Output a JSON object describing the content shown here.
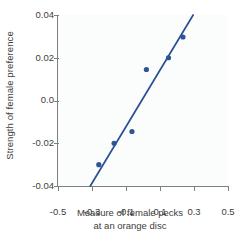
{
  "chart_data": {
    "type": "scatter",
    "title": "",
    "xlabel": "Measure of female pecks at an orange disc",
    "xlabel_line1": "Measure of female pecks",
    "xlabel_line2": "at an orange disc",
    "ylabel": "Strength of female preference",
    "xlim": [
      -0.5,
      0.5
    ],
    "ylim": [
      -0.04,
      0.04
    ],
    "xticks": [
      "-0.5",
      "-0.3",
      "-0.1",
      "0.1",
      "0.3",
      "0.5"
    ],
    "xtick_values": [
      -0.5,
      -0.3,
      -0.1,
      0.1,
      0.3,
      0.5
    ],
    "yticks": [
      "0.04",
      "0.02",
      "0.0",
      "-0.02",
      "-0.04"
    ],
    "ytick_values": [
      0.04,
      0.02,
      0.0,
      -0.02,
      -0.04
    ],
    "grid": false,
    "legend": "none",
    "point_color": "#2e5496",
    "line_color": "#2b4f94",
    "plot_background": "#fbfcfc",
    "axis_color": "#7e7e7e",
    "points": [
      {
        "x": -0.26,
        "y": -0.03
      },
      {
        "x": -0.17,
        "y": -0.02
      },
      {
        "x": -0.065,
        "y": -0.0145
      },
      {
        "x": 0.02,
        "y": 0.0145
      },
      {
        "x": 0.15,
        "y": 0.02
      },
      {
        "x": 0.235,
        "y": 0.0297
      }
    ],
    "series": [
      {
        "name": "observations",
        "x": [
          -0.26,
          -0.17,
          -0.065,
          0.02,
          0.15,
          0.235
        ],
        "values": [
          -0.03,
          -0.02,
          -0.0145,
          0.0145,
          0.02,
          0.0297
        ]
      }
    ],
    "trendline": {
      "type": "line",
      "x_start": -0.31,
      "y_start": -0.04,
      "x_end": 0.295,
      "y_end": 0.04,
      "slope": 0.132,
      "intercept": 0.0009
    }
  }
}
